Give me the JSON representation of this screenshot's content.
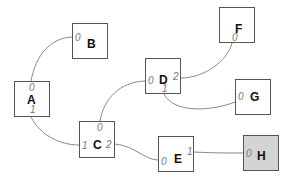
{
  "diagram": {
    "type": "node-port graph",
    "edge_color": "#8a8a8a",
    "node_border_color": "#555555",
    "highlight_fill": "#d4d4d4",
    "nodes": {
      "A": {
        "label": "A",
        "ports": {
          "top": "0",
          "bottom": "1"
        }
      },
      "B": {
        "label": "B",
        "ports": {
          "left": "0"
        }
      },
      "C": {
        "label": "C",
        "ports": {
          "top": "0",
          "left": "1",
          "right": "2"
        }
      },
      "D": {
        "label": "D",
        "ports": {
          "left": "0",
          "bottom": "1",
          "right": "2"
        }
      },
      "E": {
        "label": "E",
        "ports": {
          "left": "0",
          "right": "1"
        }
      },
      "F": {
        "label": "F",
        "ports": {
          "bottom": "0"
        }
      },
      "G": {
        "label": "G",
        "ports": {
          "left": "0"
        }
      },
      "H": {
        "label": "H",
        "ports": {
          "left": "0"
        },
        "highlighted": true
      }
    },
    "edges": [
      {
        "from": "A",
        "from_port": "0",
        "to": "B",
        "to_port": "0"
      },
      {
        "from": "A",
        "from_port": "1",
        "to": "C",
        "to_port": "1"
      },
      {
        "from": "C",
        "from_port": "0",
        "to": "D",
        "to_port": "0"
      },
      {
        "from": "D",
        "from_port": "2",
        "to": "F",
        "to_port": "0"
      },
      {
        "from": "D",
        "from_port": "1",
        "to": "G",
        "to_port": "0"
      },
      {
        "from": "C",
        "from_port": "2",
        "to": "E",
        "to_port": "0"
      },
      {
        "from": "E",
        "from_port": "1",
        "to": "H",
        "to_port": "0"
      }
    ]
  }
}
